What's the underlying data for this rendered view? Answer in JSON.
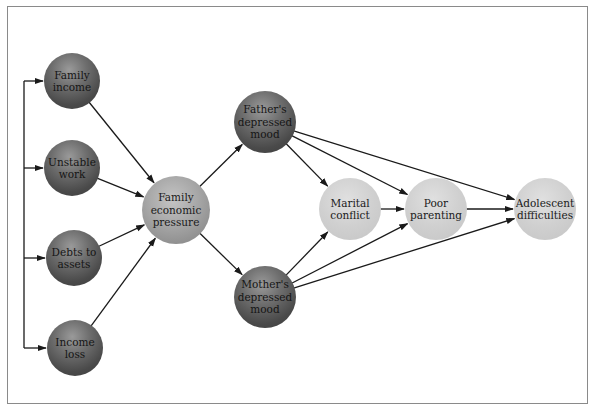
{
  "diagram": {
    "type": "causal-path-model",
    "nodes": [
      {
        "id": "family-income",
        "label": "Family\nincome",
        "style": "dark",
        "cx": 72,
        "cy": 81,
        "r": 28
      },
      {
        "id": "unstable-work",
        "label": "Unstable\nwork",
        "style": "dark",
        "cx": 72,
        "cy": 168,
        "r": 28
      },
      {
        "id": "debts-to-assets",
        "label": "Debts to\nassets",
        "style": "dark",
        "cx": 74,
        "cy": 258,
        "r": 28
      },
      {
        "id": "income-loss",
        "label": "Income\nloss",
        "style": "dark",
        "cx": 75,
        "cy": 348,
        "r": 28
      },
      {
        "id": "family-economic-pressure",
        "label": "Family\neconomic\npressure",
        "style": "mid",
        "cx": 176,
        "cy": 210,
        "r": 34
      },
      {
        "id": "fathers-depressed-mood",
        "label": "Father's\ndepressed\nmood",
        "style": "dark",
        "cx": 265,
        "cy": 122,
        "r": 31
      },
      {
        "id": "mothers-depressed-mood",
        "label": "Mother's\ndepressed\nmood",
        "style": "dark",
        "cx": 265,
        "cy": 297,
        "r": 31
      },
      {
        "id": "marital-conflict",
        "label": "Marital\nconflict",
        "style": "light",
        "cx": 350,
        "cy": 209,
        "r": 31
      },
      {
        "id": "poor-parenting",
        "label": "Poor\nparenting",
        "style": "light",
        "cx": 436,
        "cy": 209,
        "r": 31
      },
      {
        "id": "adolescent-difficulties",
        "label": "Adolescent\ndifficulties",
        "style": "light",
        "cx": 545,
        "cy": 209,
        "r": 31
      }
    ],
    "edges": [
      {
        "from": "family-income",
        "to": "family-economic-pressure"
      },
      {
        "from": "unstable-work",
        "to": "family-economic-pressure"
      },
      {
        "from": "debts-to-assets",
        "to": "family-economic-pressure"
      },
      {
        "from": "income-loss",
        "to": "family-economic-pressure"
      },
      {
        "from": "family-economic-pressure",
        "to": "fathers-depressed-mood"
      },
      {
        "from": "family-economic-pressure",
        "to": "mothers-depressed-mood"
      },
      {
        "from": "fathers-depressed-mood",
        "to": "marital-conflict"
      },
      {
        "from": "fathers-depressed-mood",
        "to": "poor-parenting"
      },
      {
        "from": "fathers-depressed-mood",
        "to": "adolescent-difficulties"
      },
      {
        "from": "mothers-depressed-mood",
        "to": "marital-conflict"
      },
      {
        "from": "mothers-depressed-mood",
        "to": "poor-parenting"
      },
      {
        "from": "mothers-depressed-mood",
        "to": "adolescent-difficulties"
      },
      {
        "from": "marital-conflict",
        "to": "poor-parenting"
      },
      {
        "from": "poor-parenting",
        "to": "adolescent-difficulties"
      }
    ],
    "bracket": {
      "x": 24,
      "targets": [
        "family-income",
        "unstable-work",
        "debts-to-assets",
        "income-loss"
      ]
    },
    "colors": {
      "border": "#8a8a8a",
      "edge": "#1a1a1a",
      "dark_node": "#4a4a4a",
      "mid_node": "#a6a6a6",
      "light_node": "#d0d0d0"
    }
  }
}
